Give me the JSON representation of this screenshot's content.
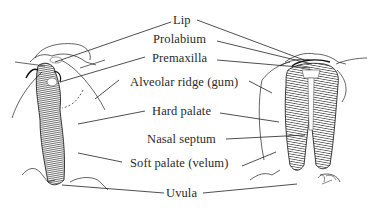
{
  "diagram": {
    "labels": {
      "lip": "Lip",
      "prolabium": "Prolabium",
      "premaxilla": "Premaxilla",
      "alveolar_ridge": "Alveolar ridge (gum)",
      "hard_palate": "Hard palate",
      "nasal_septum": "Nasal septum",
      "soft_palate": "Soft palate (velum)",
      "uvula": "Uvula"
    },
    "illustrations": [
      {
        "name": "unilateral-cleft-illustration",
        "position": "left"
      },
      {
        "name": "bilateral-cleft-illustration",
        "position": "right"
      }
    ],
    "colors": {
      "ink": "#1a1a1a",
      "text": "#2a2a2a",
      "background": "#ffffff"
    }
  }
}
